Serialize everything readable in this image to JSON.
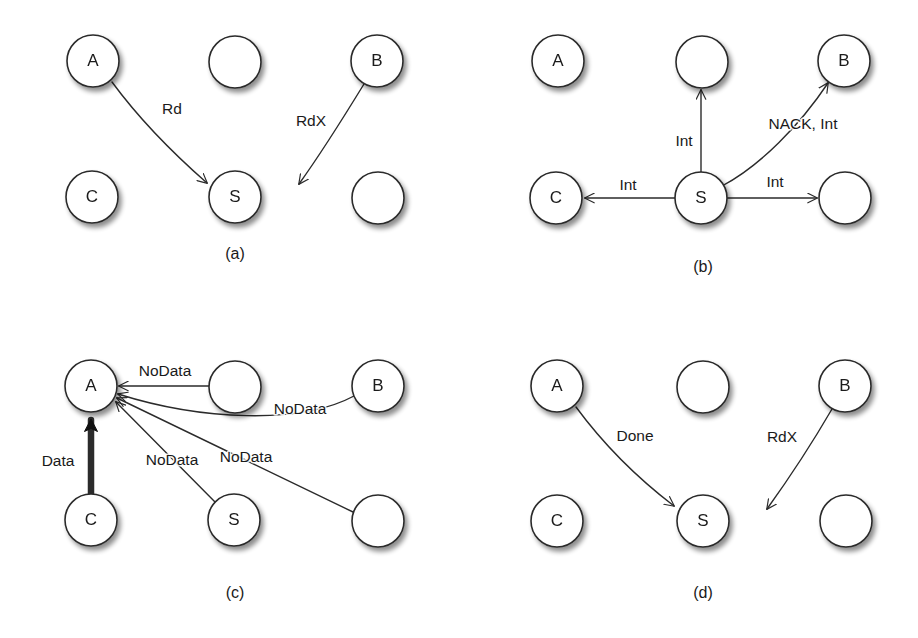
{
  "figure": {
    "background_color": "#ffffff",
    "stroke_color": "#2b2b2b",
    "text_color": "#1a1a1a",
    "node_radius": 26,
    "panels": [
      {
        "id": "panel-a",
        "caption": "(a)",
        "caption_pos": {
          "x": 235,
          "y": 255
        },
        "nodes": [
          {
            "name": "A",
            "label": "A",
            "cx": 93,
            "cy": 61
          },
          {
            "name": "top-middle",
            "label": "",
            "cx": 235,
            "cy": 62
          },
          {
            "name": "B",
            "label": "B",
            "cx": 377,
            "cy": 61
          },
          {
            "name": "C",
            "label": "C",
            "cx": 92,
            "cy": 197
          },
          {
            "name": "S",
            "label": "S",
            "cx": 235,
            "cy": 197
          },
          {
            "name": "bottom-right",
            "label": "",
            "cx": 378,
            "cy": 198
          }
        ],
        "edges": [
          {
            "name": "edge-a-to-s",
            "label": "Rd",
            "label_pos": {
              "x": 172,
              "y": 110
            },
            "path": "M 112 82 C 140 120 175 155 207 183",
            "arrow": true,
            "thick": false
          },
          {
            "name": "edge-b-to-empty",
            "label": "RdX",
            "label_pos": {
              "x": 311,
              "y": 122
            },
            "path": "M 364 84 C 345 115 322 152 299 184",
            "arrow": true,
            "thick": false
          }
        ]
      },
      {
        "id": "panel-b",
        "caption": "(b)",
        "caption_pos": {
          "x": 703,
          "y": 268
        },
        "nodes": [
          {
            "name": "A",
            "label": "A",
            "cx": 558,
            "cy": 61
          },
          {
            "name": "top-middle",
            "label": "",
            "cx": 702,
            "cy": 62
          },
          {
            "name": "B",
            "label": "B",
            "cx": 844,
            "cy": 61
          },
          {
            "name": "C",
            "label": "C",
            "cx": 556,
            "cy": 198
          },
          {
            "name": "S",
            "label": "S",
            "cx": 701,
            "cy": 198
          },
          {
            "name": "bottom-right",
            "label": "",
            "cx": 845,
            "cy": 198
          }
        ],
        "edges": [
          {
            "name": "edge-s-to-top-middle",
            "label": "Int",
            "label_pos": {
              "x": 684,
              "y": 142
            },
            "path": "M 701 172 L 701 90",
            "arrow": true,
            "thick": false
          },
          {
            "name": "edge-s-to-b",
            "label": "NACK, Int",
            "label_pos": {
              "x": 803,
              "y": 125
            },
            "path": "M 722 186 C 760 166 800 125 828 83",
            "arrow": true,
            "thick": false
          },
          {
            "name": "edge-s-to-c",
            "label": "Int",
            "label_pos": {
              "x": 628,
              "y": 186
            },
            "path": "M 675 198 L 585 198",
            "arrow": true,
            "thick": false
          },
          {
            "name": "edge-s-to-bottom-right",
            "label": "Int",
            "label_pos": {
              "x": 775,
              "y": 183
            },
            "path": "M 727 198 L 817 198",
            "arrow": true,
            "thick": false
          }
        ]
      },
      {
        "id": "panel-c",
        "caption": "(c)",
        "caption_pos": {
          "x": 235,
          "y": 594
        },
        "nodes": [
          {
            "name": "A",
            "label": "A",
            "cx": 91,
            "cy": 386
          },
          {
            "name": "top-middle",
            "label": "",
            "cx": 235,
            "cy": 387
          },
          {
            "name": "B",
            "label": "B",
            "cx": 378,
            "cy": 386
          },
          {
            "name": "C",
            "label": "C",
            "cx": 91,
            "cy": 520
          },
          {
            "name": "S",
            "label": "S",
            "cx": 234,
            "cy": 520
          },
          {
            "name": "bottom-right",
            "label": "",
            "cx": 378,
            "cy": 521
          }
        ],
        "edges": [
          {
            "name": "edge-top-middle-to-a",
            "label": "NoData",
            "label_pos": {
              "x": 165,
              "y": 372
            },
            "path": "M 209 386 L 119 386",
            "arrow": true,
            "thick": false
          },
          {
            "name": "edge-b-to-a",
            "label": "NoData",
            "label_pos": {
              "x": 300,
              "y": 410
            },
            "path": "M 354 396 C 300 425 200 420 118 394",
            "arrow": true,
            "thick": false
          },
          {
            "name": "edge-s-to-a",
            "label": "NoData",
            "label_pos": {
              "x": 172,
              "y": 461
            },
            "path": "M 216 503 L 116 402",
            "arrow": true,
            "thick": false
          },
          {
            "name": "edge-bottom-right-to-a",
            "label": "NoData",
            "label_pos": {
              "x": 246,
              "y": 458
            },
            "path": "M 353 512 L 117 398",
            "arrow": true,
            "thick": false
          },
          {
            "name": "edge-c-to-a-data",
            "label": "Data",
            "label_pos": {
              "x": 58,
              "y": 462
            },
            "path": "M 91 494 L 91 420",
            "arrow": true,
            "thick": true
          }
        ]
      },
      {
        "id": "panel-d",
        "caption": "(d)",
        "caption_pos": {
          "x": 703,
          "y": 594
        },
        "nodes": [
          {
            "name": "A",
            "label": "A",
            "cx": 557,
            "cy": 386
          },
          {
            "name": "top-middle",
            "label": "",
            "cx": 703,
            "cy": 387
          },
          {
            "name": "B",
            "label": "B",
            "cx": 845,
            "cy": 386
          },
          {
            "name": "C",
            "label": "C",
            "cx": 557,
            "cy": 521
          },
          {
            "name": "S",
            "label": "S",
            "cx": 703,
            "cy": 521
          },
          {
            "name": "bottom-right",
            "label": "",
            "cx": 846,
            "cy": 521
          }
        ],
        "edges": [
          {
            "name": "edge-a-to-s",
            "label": "Done",
            "label_pos": {
              "x": 635,
              "y": 437
            },
            "path": "M 576 407 C 604 445 640 480 674 506",
            "arrow": true,
            "thick": false
          },
          {
            "name": "edge-b-to-empty",
            "label": "RdX",
            "label_pos": {
              "x": 782,
              "y": 438
            },
            "path": "M 832 409 C 814 440 790 477 767 509",
            "arrow": true,
            "thick": false
          }
        ]
      }
    ]
  }
}
